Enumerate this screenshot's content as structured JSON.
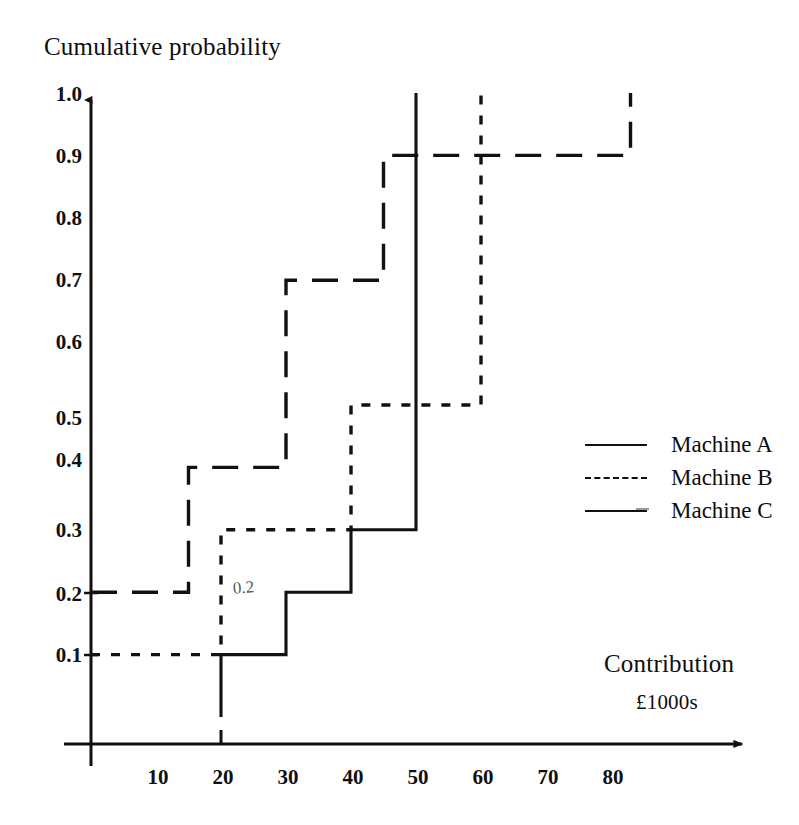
{
  "title": "Cumulative probability",
  "axes": {
    "y_title": "Cumulative probability",
    "x_title": "Contribution",
    "x_units": "£1000s",
    "y_ticks": [
      "1.0",
      "0.9",
      "0.8",
      "0.7",
      "0.6",
      "0.5",
      "0.4",
      "0.3",
      "0.2",
      "0.1"
    ],
    "x_ticks": [
      "10",
      "20",
      "30",
      "40",
      "50",
      "60",
      "70",
      "80"
    ]
  },
  "annotation": "0.2",
  "legend": {
    "items": [
      {
        "label": "Machine A",
        "style": "solid"
      },
      {
        "label": "Machine B",
        "style": "dotted"
      },
      {
        "label": "Machine C",
        "style": "solid-with-tail"
      }
    ]
  },
  "colors": {
    "ink": "#111111",
    "background": "#ffffff",
    "annotation": "#5a5a5a"
  },
  "chart_data": {
    "type": "line",
    "title": "Cumulative probability",
    "xlabel": "Contribution £1000s",
    "ylabel": "Cumulative probability",
    "xlim": [
      0,
      90
    ],
    "ylim": [
      0,
      1.0
    ],
    "grid": false,
    "legend_position": "right",
    "step_style": "post",
    "series": [
      {
        "name": "Machine A",
        "style": "solid",
        "points": [
          [
            20,
            0.0
          ],
          [
            20,
            0.1
          ],
          [
            30,
            0.1
          ],
          [
            30,
            0.2
          ],
          [
            40,
            0.2
          ],
          [
            40,
            0.3
          ],
          [
            50,
            0.3
          ],
          [
            50,
            1.0
          ]
        ]
      },
      {
        "name": "Machine B",
        "style": "dotted",
        "points": [
          [
            0,
            0.1
          ],
          [
            20,
            0.1
          ],
          [
            20,
            0.3
          ],
          [
            40,
            0.3
          ],
          [
            40,
            0.5
          ],
          [
            60,
            0.5
          ],
          [
            60,
            1.0
          ]
        ]
      },
      {
        "name": "Machine C",
        "style": "dashed",
        "points": [
          [
            0,
            0.2
          ],
          [
            15,
            0.2
          ],
          [
            15,
            0.4
          ],
          [
            30,
            0.4
          ],
          [
            30,
            0.7
          ],
          [
            45,
            0.7
          ],
          [
            45,
            0.9
          ],
          [
            83,
            0.9
          ],
          [
            83,
            1.0
          ]
        ]
      }
    ]
  }
}
